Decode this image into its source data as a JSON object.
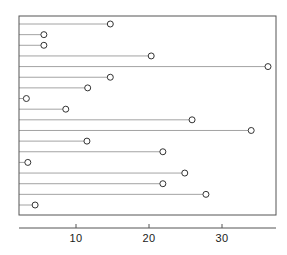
{
  "chart_data": {
    "type": "scatter",
    "variant": "dot-plot-with-leader-lines",
    "title": "",
    "subtitle": "",
    "xlabel": "",
    "ylabel": "",
    "xlim": [
      0.6,
      38.0
    ],
    "ylim_rows": 18,
    "grid": false,
    "legend": null,
    "xticks": [
      10,
      20,
      30
    ],
    "xtick_labels": [
      "10",
      "20",
      "30"
    ],
    "yticks": [],
    "ytick_labels": [],
    "marker": "open-circle",
    "marker_edge_color": "#333333",
    "marker_face_color": "#ffffff",
    "line_color": "#8c8c8c",
    "axis_color": "#555555",
    "background_color": "#ffffff",
    "categories": [
      "row-1",
      "row-2",
      "row-3",
      "row-4",
      "row-5",
      "row-6",
      "row-7",
      "row-8",
      "row-9",
      "row-10",
      "row-11",
      "row-12",
      "row-13",
      "row-14",
      "row-15",
      "row-16",
      "row-17",
      "row-18"
    ],
    "values": [
      14.7,
      5.6,
      5.6,
      20.3,
      36.3,
      14.7,
      11.6,
      3.2,
      8.6,
      25.9,
      34.0,
      11.5,
      21.9,
      3.4,
      24.9,
      21.9,
      27.8,
      4.4
    ]
  },
  "axis": {
    "x_tick_1": "10",
    "x_tick_2": "20",
    "x_tick_3": "30"
  }
}
